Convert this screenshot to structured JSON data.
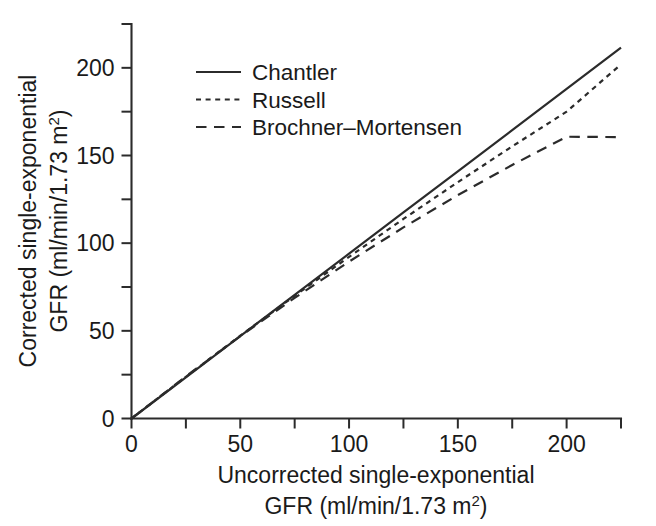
{
  "chart_data": {
    "type": "line",
    "title": "",
    "xlabel": "Uncorrected single-exponential GFR (ml/min/1.73 m2)",
    "ylabel": "Corrected single-exponential GFR (ml/min/1.73 m2)",
    "xlabel_line1": "Uncorrected single-exponential",
    "xlabel_line2_prefix": "GFR (ml/min/1.73 m",
    "xlabel_line2_sup": "2",
    "xlabel_line2_suffix": ")",
    "ylabel_line1": "Corrected single-exponential",
    "ylabel_line2_prefix": "GFR (ml/min/1.73 m",
    "ylabel_line2_sup": "2",
    "ylabel_line2_suffix": ")",
    "xlim": [
      0,
      225
    ],
    "ylim": [
      0,
      225
    ],
    "xticks_major": [
      0,
      50,
      100,
      150,
      200
    ],
    "xticks_major_labels": [
      "0",
      "50",
      "100",
      "150",
      "200"
    ],
    "xticks_minor": [
      25,
      75,
      125,
      175,
      225
    ],
    "yticks_major": [
      0,
      50,
      100,
      150,
      200
    ],
    "yticks_major_labels": [
      "0",
      "50",
      "100",
      "150",
      "200"
    ],
    "yticks_minor": [
      25,
      75,
      125,
      175,
      225
    ],
    "grid": false,
    "legend_position": "upper-left-inside",
    "x": [
      0,
      25,
      50,
      75,
      100,
      125,
      150,
      175,
      200,
      225
    ],
    "series": [
      {
        "name": "Chantler",
        "style": "solid",
        "color": "#2b2b2b",
        "values": [
          0,
          23.5,
          47,
          70.5,
          94,
          117.5,
          141,
          164.5,
          188,
          211.5
        ]
      },
      {
        "name": "Russell",
        "style": "dotted",
        "color": "#2b2b2b",
        "values": [
          0,
          23.8,
          47.2,
          70.0,
          92.2,
          113.8,
          134.8,
          155.2,
          175.0,
          202.0
        ]
      },
      {
        "name": "Brochner-Mortensen",
        "style": "dashed",
        "color": "#2b2b2b",
        "values": [
          0,
          24.0,
          47.0,
          68.8,
          89.5,
          109.0,
          127.4,
          144.6,
          160.7,
          160.5
        ]
      }
    ]
  },
  "legend": {
    "entries": [
      {
        "label": "Chantler",
        "style": "solid"
      },
      {
        "label": "Russell",
        "style": "dotted"
      },
      {
        "label": "Brochner–Mortensen",
        "style": "dashed"
      }
    ]
  },
  "ticks": {
    "x": [
      "0",
      "50",
      "100",
      "150",
      "200"
    ],
    "y": [
      "0",
      "50",
      "100",
      "150",
      "200"
    ]
  },
  "colors": {
    "ink": "#2b2b2b",
    "background": "#ffffff"
  }
}
